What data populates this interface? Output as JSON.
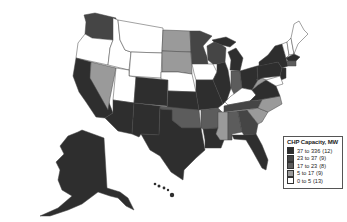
{
  "legend": {
    "title": "CHP Capacity, MW",
    "classes": [
      {
        "range": "37 to 336",
        "count": "(12)",
        "color": "#2e2e2e"
      },
      {
        "range": "23 to  37",
        "count": "(9)",
        "color": "#454545"
      },
      {
        "range": "17 to  23",
        "count": "(8)",
        "color": "#5c5c5c"
      },
      {
        "range": "5 to  17",
        "count": "(9)",
        "color": "#9a9a9a"
      },
      {
        "range": "0 to   5",
        "count": "(13)",
        "color": "#ffffff"
      }
    ]
  },
  "colors": {
    "c1": "#2e2e2e",
    "c2": "#454545",
    "c3": "#5c5c5c",
    "c4": "#9a9a9a",
    "c5": "#ffffff",
    "border": "#444444",
    "background": "#ffffff"
  }
}
